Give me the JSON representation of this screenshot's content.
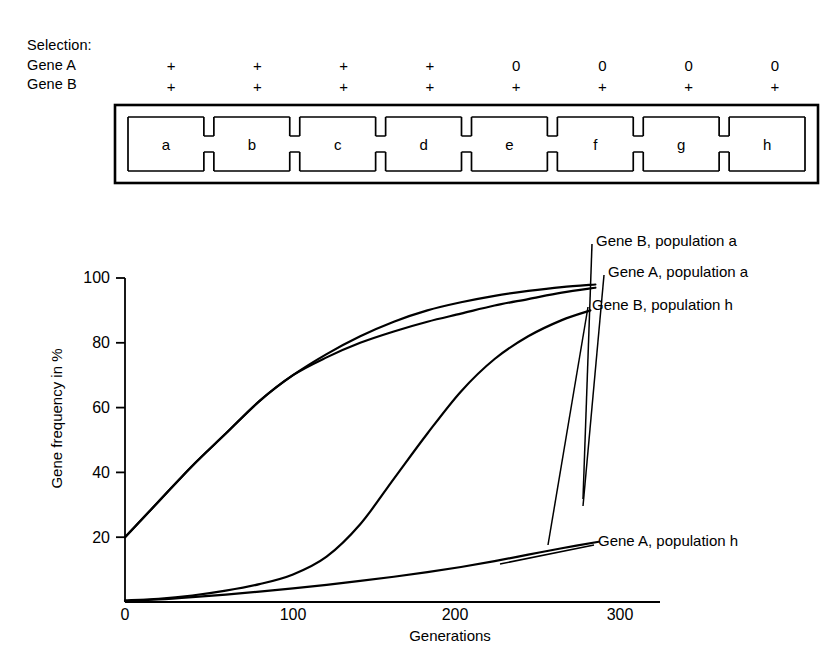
{
  "header": {
    "selection_title": "Selection:",
    "gene_a_label": "Gene A",
    "gene_b_label": "Gene B",
    "gene_a_values": [
      "+",
      "+",
      "+",
      "+",
      "0",
      "0",
      "0",
      "0"
    ],
    "gene_b_values": [
      "+",
      "+",
      "+",
      "+",
      "+",
      "+",
      "+",
      "+"
    ]
  },
  "cage": {
    "chambers": [
      "a",
      "b",
      "c",
      "d",
      "e",
      "f",
      "g",
      "h"
    ]
  },
  "chart_data": {
    "type": "line",
    "title": "",
    "xlabel": "Generations",
    "ylabel": "Gene frequency in %",
    "xlim": [
      0,
      320
    ],
    "ylim": [
      0,
      100
    ],
    "xticks": [
      0,
      100,
      200,
      300
    ],
    "yticks": [
      0,
      20,
      40,
      60,
      80,
      100
    ],
    "xtick_labels": [
      "0",
      "100",
      "200",
      "300"
    ],
    "ytick_labels": [
      "0",
      "20",
      "40",
      "60",
      "80",
      "100"
    ],
    "grid": false,
    "legend_position": "inline-annotations",
    "series": [
      {
        "name": "Gene B, population a",
        "x": [
          0,
          20,
          40,
          60,
          80,
          100,
          120,
          140,
          160,
          180,
          200,
          220,
          240,
          260,
          280
        ],
        "values": [
          20,
          31,
          42,
          52,
          62,
          70,
          76.5,
          82,
          86.5,
          90,
          92.5,
          94.5,
          96,
          97.2,
          98
        ]
      },
      {
        "name": "Gene A, population a",
        "x": [
          0,
          20,
          40,
          60,
          80,
          100,
          120,
          140,
          160,
          180,
          200,
          220,
          240,
          260,
          280
        ],
        "values": [
          20,
          31,
          42,
          52,
          62,
          70,
          75.5,
          80,
          83.5,
          86.5,
          89,
          91.5,
          93.5,
          95.5,
          97
        ]
      },
      {
        "name": "Gene B, population h",
        "x": [
          0,
          20,
          40,
          60,
          80,
          100,
          120,
          140,
          160,
          180,
          200,
          220,
          240,
          260,
          277
        ],
        "values": [
          0.5,
          1,
          2,
          3.5,
          5.5,
          8.5,
          14,
          24,
          38,
          52,
          65,
          75,
          82,
          87,
          90
        ]
      },
      {
        "name": "Gene A, population h",
        "x": [
          0,
          20,
          40,
          60,
          80,
          100,
          120,
          140,
          160,
          180,
          200,
          220,
          240,
          260,
          282
        ],
        "values": [
          0.3,
          0.8,
          1.5,
          2.3,
          3.2,
          4.2,
          5.3,
          6.5,
          7.8,
          9.2,
          10.8,
          12.6,
          14.6,
          16.6,
          18.6
        ]
      }
    ],
    "annotations": [
      {
        "text": "Gene B, population a"
      },
      {
        "text": "Gene A, population a"
      },
      {
        "text": "Gene B, population h"
      },
      {
        "text": "Gene A, population h"
      }
    ]
  }
}
